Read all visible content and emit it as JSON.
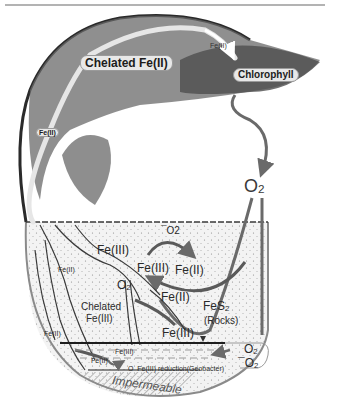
{
  "figure": {
    "type": "iron cycle diagram",
    "colors": {
      "arrow": "#6a6a6a",
      "outline": "#3a3a3a",
      "soil_fill": "#f1f1f1",
      "foliage": "#5a5a5a",
      "label_pill": "#e8e8e8",
      "background": "#ffffff"
    }
  },
  "labels": {
    "chelated_fe2_top": "Chelated Fe(II)",
    "fe2_arrow_top": "Fe(II)",
    "chlorophyll": "Chlorophyll",
    "fe2_stem": "Fe(II)",
    "o2_air": "O",
    "o2_air_sub": "2",
    "minus_o2": "¯O2",
    "fe3_soil": "Fe(III)",
    "fe3_cycle": "Fe(III)",
    "fe2_cycle": "Fe(II)",
    "fe2_root_left": "Fe(II)",
    "o2_soil": "O",
    "o2_soil_sub": "2",
    "fe2_mid": "Fe(II)",
    "fes2": "FeS",
    "fes2_sub": "2",
    "rocks": "(Rocks)",
    "chelated_fe3_line1": "Chelated",
    "chelated_fe3_line2": "Fe(III)",
    "fe3_lower": "Fe(III)",
    "fe2_lower_left": "Fe(II)",
    "fe3_water": "Fe(III)",
    "fe2_water": "Fe(II)",
    "o2_reduction_prefix": "O",
    "fe3_reduction": "Fe(III) reduction(Geobacter)",
    "o2_water_top": "O",
    "o2_water_top_sub": "2",
    "o2_water_bottom": "¯O",
    "o2_water_bottom_sub": "2",
    "impermeable": "Impermeable"
  }
}
